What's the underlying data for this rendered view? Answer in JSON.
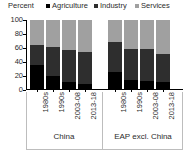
{
  "chart_data": {
    "type": "bar",
    "subtype": "stacked-100-percent",
    "title": "",
    "xlabel": "",
    "ylabel": "Percent",
    "ylim": [
      0,
      100
    ],
    "yticks": [
      0,
      20,
      40,
      60,
      80,
      100
    ],
    "grid": false,
    "legend_position": "top",
    "legend": [
      "Agriculture",
      "Industry",
      "Services"
    ],
    "colors": {
      "agriculture": "#000000",
      "industry": "#2e2e2e",
      "services": "#a0a0a0",
      "axis": "#000000",
      "text": "#2b2b2b"
    },
    "groups": [
      {
        "label": "China",
        "categories": [
          "1980s",
          "1990s",
          "2003-08",
          "2013-18"
        ]
      },
      {
        "label": "EAP excl. China",
        "categories": [
          "1980s",
          "1990s",
          "2003-08",
          "2013-18"
        ]
      }
    ],
    "categories": [
      "1980s",
      "1990s",
      "2003-08",
      "2013-18",
      "1980s",
      "1990s",
      "2003-08",
      "2013-18"
    ],
    "series": [
      {
        "name": "Agriculture",
        "color": "#000000",
        "values": [
          36,
          20,
          12,
          9,
          26,
          15,
          13,
          12
        ]
      },
      {
        "name": "Industry",
        "color": "#2e2e2e",
        "values": [
          29,
          41,
          45,
          45,
          42,
          44,
          45,
          40
        ]
      },
      {
        "name": "Services",
        "color": "#a0a0a0",
        "values": [
          35,
          39,
          43,
          46,
          32,
          41,
          42,
          48
        ]
      }
    ]
  }
}
